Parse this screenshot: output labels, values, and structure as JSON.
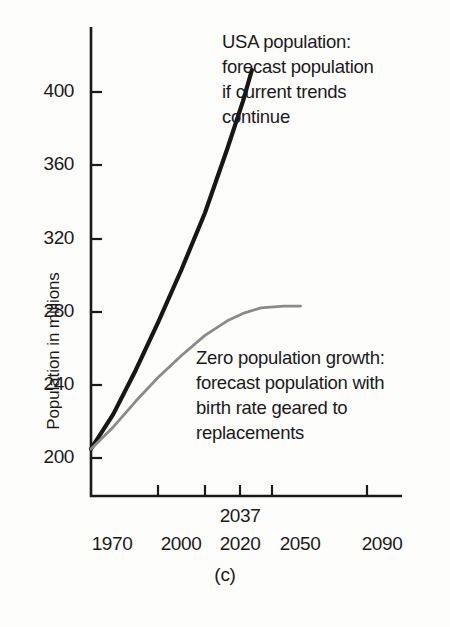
{
  "figure": {
    "caption": "(c)"
  },
  "chart_data": {
    "type": "line",
    "title": "",
    "subtitle": "",
    "xlabel": "",
    "ylabel": "Population in millions",
    "xlim": [
      1970,
      2110
    ],
    "ylim": [
      190,
      415
    ],
    "grid": false,
    "legend_position": "inline-annotation",
    "x_ticks": [
      1970,
      2000,
      2020,
      2050,
      2090
    ],
    "x_tick_labels": [
      "1970",
      "2000",
      "2020",
      "2050",
      "2090"
    ],
    "y_ticks": [
      200,
      240,
      280,
      320,
      360,
      400
    ],
    "y_tick_labels": [
      "200",
      "240",
      "280",
      "320",
      "360",
      "400"
    ],
    "annotations": [
      {
        "name": "usa-population-annotation",
        "lines": [
          "USA population:",
          "forecast population",
          "if current trends",
          "continue"
        ],
        "series": "USA population"
      },
      {
        "name": "zero-population-growth-annotation",
        "lines": [
          "Zero population growth:",
          "forecast population with",
          "birth rate geared to",
          "replacements"
        ],
        "series": "Zero population growth"
      },
      {
        "name": "x-axis-extra-year",
        "lines": [
          "2037"
        ],
        "series": ""
      }
    ],
    "series": [
      {
        "name": "USA population",
        "color": "#171717",
        "x": [
          1970,
          1980,
          1990,
          2000,
          2010,
          2020,
          2030,
          2037,
          2041
        ],
        "values": [
          205,
          224,
          248,
          274,
          303,
          334,
          369,
          395,
          412
        ]
      },
      {
        "name": "Zero population growth",
        "color": "#8a8a8a",
        "x": [
          1970,
          1980,
          1990,
          2000,
          2010,
          2020,
          2030,
          2037,
          2045,
          2055,
          2062
        ],
        "values": [
          205,
          217,
          231,
          244,
          256,
          267,
          275,
          279,
          282,
          283,
          283
        ]
      }
    ]
  }
}
